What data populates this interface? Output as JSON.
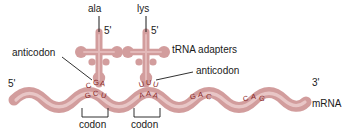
{
  "figure": {
    "colors": {
      "rna_fill": "#d29d9d",
      "rna_fill_light": "#dcaeae",
      "base_text": "#8a2b2b",
      "label_text": "#1a1a1a",
      "leader_line": "#1a1a1a",
      "background": "#ffffff"
    }
  },
  "labels": {
    "amino_acid_left": "ala",
    "amino_acid_right": "lys",
    "prime5_trna_left": "5'",
    "prime5_trna_right": "5'",
    "trna_adapters": "tRNA adapters",
    "anticodon_left": "anticodon",
    "anticodon_right": "anticodon",
    "mrna_5prime": "5'",
    "mrna_3prime": "3'",
    "mrna": "mRNA",
    "codon_left": "codon",
    "codon_right": "codon"
  },
  "sequences": {
    "anticodon_left_bases": "CGA",
    "anticodon_right_bases": "UUU",
    "codon_left_bases": "GCU",
    "codon_right_bases": "AAA",
    "mrna_extra_1": "GAC",
    "mrna_extra_2": "CAG"
  },
  "bases": {
    "anticodon_left": [
      {
        "ch": "C",
        "x": 86,
        "y": 82,
        "rot": -18
      },
      {
        "ch": "G",
        "x": 93,
        "y": 79,
        "rot": -4
      },
      {
        "ch": "A",
        "x": 100,
        "y": 80,
        "rot": 10
      }
    ],
    "anticodon_right": [
      {
        "ch": "U",
        "x": 139,
        "y": 81,
        "rot": -14
      },
      {
        "ch": "U",
        "x": 146,
        "y": 79,
        "rot": 0
      },
      {
        "ch": "U",
        "x": 153,
        "y": 81,
        "rot": 14
      }
    ],
    "codon_left": [
      {
        "ch": "G",
        "x": 85,
        "y": 92,
        "rot": -18
      },
      {
        "ch": "C",
        "x": 93,
        "y": 90,
        "rot": -2
      },
      {
        "ch": "U",
        "x": 101,
        "y": 92,
        "rot": 14
      }
    ],
    "codon_right": [
      {
        "ch": "A",
        "x": 139,
        "y": 92,
        "rot": -16
      },
      {
        "ch": "A",
        "x": 146,
        "y": 90,
        "rot": 0
      },
      {
        "ch": "A",
        "x": 153,
        "y": 92,
        "rot": 16
      }
    ],
    "extra_1": [
      {
        "ch": "G",
        "x": 190,
        "y": 93,
        "rot": -16
      },
      {
        "ch": "A",
        "x": 198,
        "y": 91,
        "rot": 0
      },
      {
        "ch": "C",
        "x": 206,
        "y": 93,
        "rot": 16
      }
    ],
    "extra_2": [
      {
        "ch": "C",
        "x": 243,
        "y": 95,
        "rot": -16
      },
      {
        "ch": "A",
        "x": 251,
        "y": 93,
        "rot": 0
      },
      {
        "ch": "G",
        "x": 259,
        "y": 95,
        "rot": 16
      }
    ]
  }
}
